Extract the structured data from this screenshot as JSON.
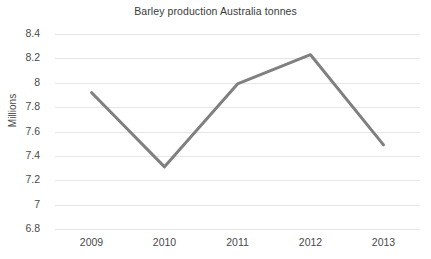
{
  "chart_data": {
    "type": "line",
    "title": "Barley production Australia tonnes",
    "xlabel": "",
    "ylabel": "Millions",
    "categories": [
      "2009",
      "2010",
      "2011",
      "2012",
      "2013"
    ],
    "x": [
      2009,
      2010,
      2011,
      2012,
      2013
    ],
    "values": [
      7.92,
      7.31,
      7.99,
      8.23,
      7.49
    ],
    "series": [
      {
        "name": "Barley production",
        "values": [
          7.92,
          7.31,
          7.99,
          8.23,
          7.49
        ],
        "color": "#808080"
      }
    ],
    "ylim": [
      6.8,
      8.4
    ],
    "ytick_step": 0.2,
    "yticks": [
      8.4,
      8.2,
      8,
      7.8,
      7.6,
      7.4,
      7.2,
      7,
      6.8
    ],
    "ytick_labels": [
      "8.4",
      "8.2",
      "8",
      "7.8",
      "7.6",
      "7.4",
      "7.2",
      "7",
      "6.8"
    ],
    "grid": true,
    "grid_color": "#e6e6e6",
    "grid_axis": "y",
    "legend": false,
    "legend_position": "none",
    "line_width": 3,
    "markers": false,
    "background": "#ffffff",
    "text_color": "#4a4a4a"
  }
}
